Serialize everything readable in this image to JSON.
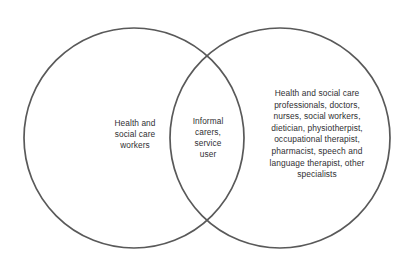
{
  "diagram": {
    "type": "venn",
    "sets": 2,
    "background_color": "#ffffff",
    "stroke_color": "#595959",
    "stroke_width": 1.7,
    "text_color": "#2f2f33",
    "left_circle": {
      "name": "health-and-social-care-workers",
      "center_x": 134,
      "center_y": 138,
      "radius": 110,
      "label": "Health and\nsocial care\nworkers"
    },
    "right_circle": {
      "name": "health-and-social-care-professionals",
      "center_x": 280,
      "center_y": 138,
      "radius": 110,
      "label": "Health and social care\nprofessionals, doctors,\nnurses, social workers,\ndietician, physiotherpist,\noccupational therapist,\npharmacist, speech and\nlanguage therapist, other\nspecialists"
    },
    "intersection": {
      "name": "informal-carers-service-user",
      "label": "Informal\ncarers,\nservice\nuser"
    }
  }
}
